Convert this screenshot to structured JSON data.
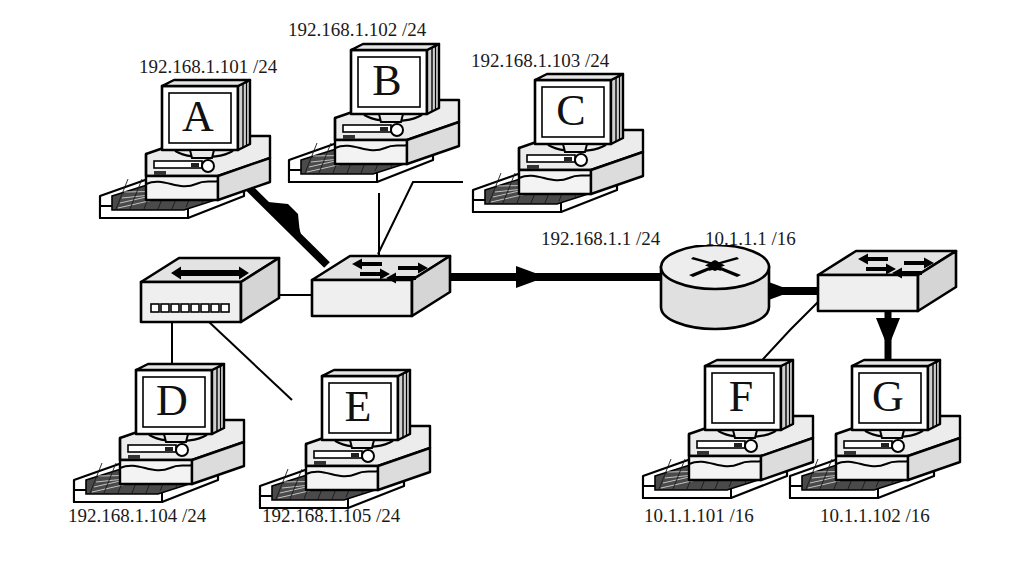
{
  "diagram": {
    "background_color": "#ffffff",
    "line_color": "#000000",
    "device_fill": "#e8e8e8"
  },
  "hosts": [
    {
      "id": "A",
      "name": "A",
      "address": "192.168.1.101 /24",
      "label_position": "above"
    },
    {
      "id": "B",
      "name": "B",
      "address": "192.168.1.102 /24",
      "label_position": "above"
    },
    {
      "id": "C",
      "name": "C",
      "address": "192.168.1.103 /24",
      "label_position": "above"
    },
    {
      "id": "D",
      "name": "D",
      "address": "192.168.1.104 /24",
      "label_position": "below"
    },
    {
      "id": "E",
      "name": "E",
      "address": "192.168.1.105 /24",
      "label_position": "below"
    },
    {
      "id": "F",
      "name": "F",
      "address": "10.1.1.101 /16",
      "label_position": "below"
    },
    {
      "id": "G",
      "name": "G",
      "address": "10.1.1.102 /16",
      "label_position": "below"
    }
  ],
  "infrastructure": [
    {
      "id": "hub",
      "type": "hub",
      "label": ""
    },
    {
      "id": "switch-left",
      "type": "switch",
      "label": ""
    },
    {
      "id": "router",
      "type": "router",
      "interfaces": [
        {
          "name": "lan",
          "address": "192.168.1.1 /24"
        },
        {
          "name": "wan",
          "address": "10.1.1.1 /16"
        }
      ]
    },
    {
      "id": "switch-right",
      "type": "switch",
      "label": ""
    }
  ],
  "router_labels": {
    "left": "192.168.1.1 /24",
    "right": "10.1.1.1 /16"
  },
  "links": [
    {
      "from": "A",
      "to": "switch-left",
      "style": "bold-arrow"
    },
    {
      "from": "B",
      "to": "switch-left",
      "style": "thin"
    },
    {
      "from": "C",
      "to": "switch-left",
      "style": "thin"
    },
    {
      "from": "hub",
      "to": "switch-left",
      "style": "thin"
    },
    {
      "from": "hub",
      "to": "D",
      "style": "thin"
    },
    {
      "from": "hub",
      "to": "E",
      "style": "thin"
    },
    {
      "from": "switch-left",
      "to": "router",
      "style": "bold-arrow"
    },
    {
      "from": "router",
      "to": "switch-right",
      "style": "bold-arrow"
    },
    {
      "from": "switch-right",
      "to": "F",
      "style": "thin"
    },
    {
      "from": "switch-right",
      "to": "G",
      "style": "bold-arrow"
    }
  ]
}
